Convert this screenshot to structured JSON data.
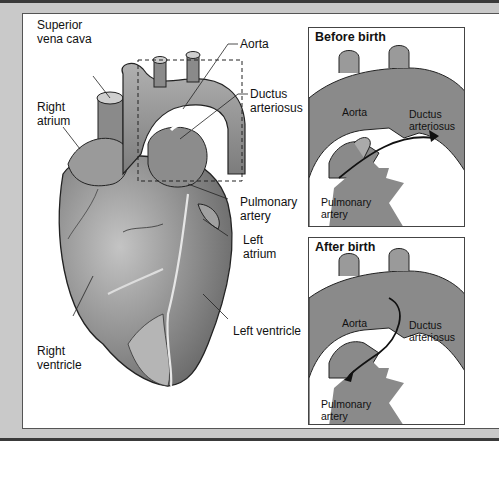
{
  "diagram": {
    "main_labels": {
      "superior_vena_cava": [
        "Superior",
        "vena cava"
      ],
      "right_atrium": [
        "Right",
        "atrium"
      ],
      "aorta": "Aorta",
      "ductus_arteriosus": [
        "Ductus",
        "arteriosus"
      ],
      "pulmonary_artery": [
        "Pulmonary",
        "artery"
      ],
      "left_atrium": [
        "Left",
        "atrium"
      ],
      "left_ventricle": "Left ventricle",
      "right_ventricle": [
        "Right",
        "ventricle"
      ]
    },
    "panels": [
      {
        "title": "Before birth",
        "labels": {
          "aorta": "Aorta",
          "ductus_arteriosus": [
            "Ductus",
            "arteriosus"
          ],
          "pulmonary_artery": [
            "Pulmonary",
            "artery"
          ]
        },
        "flow": "pulmonary artery to aorta"
      },
      {
        "title": "After birth",
        "labels": {
          "aorta": "Aorta",
          "ductus_arteriosus": [
            "Ductus",
            "arteriosus"
          ],
          "pulmonary_artery": [
            "Pulmonary",
            "artery"
          ]
        },
        "flow": "aorta to pulmonary artery"
      }
    ],
    "colors": {
      "frame": "#c9c9c9",
      "border": "#3a3a3a",
      "tissue_dark": "#7a7a7a",
      "tissue_mid": "#9a9a9a",
      "tissue_light": "#b8b8b8",
      "outline": "#222222"
    }
  }
}
